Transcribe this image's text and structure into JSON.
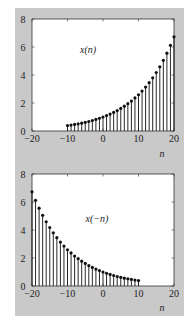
{
  "chart_data": [
    {
      "type": "stem",
      "title": "",
      "series_label": "x(n)",
      "xlabel": "n",
      "ylabel": "",
      "xlim": [
        -20,
        20
      ],
      "ylim": [
        0,
        8
      ],
      "xticks": [
        "-20",
        "-10",
        "0",
        "10",
        "20"
      ],
      "yticks": [
        "0",
        "2",
        "4",
        "6",
        "8"
      ],
      "grid": false,
      "x": [
        -10,
        -9,
        -8,
        -7,
        -6,
        -5,
        -4,
        -3,
        -2,
        -1,
        0,
        1,
        2,
        3,
        4,
        5,
        6,
        7,
        8,
        9,
        10,
        11,
        12,
        13,
        14,
        15,
        16,
        17,
        18,
        19,
        20
      ],
      "values": [
        0.39,
        0.42,
        0.47,
        0.51,
        0.56,
        0.62,
        0.68,
        0.75,
        0.83,
        0.91,
        1.0,
        1.1,
        1.21,
        1.33,
        1.46,
        1.61,
        1.77,
        1.95,
        2.14,
        2.36,
        2.59,
        2.85,
        3.14,
        3.45,
        3.8,
        4.18,
        4.59,
        5.05,
        5.56,
        6.12,
        6.73
      ]
    },
    {
      "type": "stem",
      "title": "",
      "series_label": "x(−n)",
      "xlabel": "n",
      "ylabel": "",
      "xlim": [
        -20,
        20
      ],
      "ylim": [
        0,
        8
      ],
      "xticks": [
        "-20",
        "-10",
        "0",
        "10",
        "20"
      ],
      "yticks": [
        "0",
        "2",
        "4",
        "6",
        "8"
      ],
      "grid": false,
      "x": [
        -20,
        -19,
        -18,
        -17,
        -16,
        -15,
        -14,
        -13,
        -12,
        -11,
        -10,
        -9,
        -8,
        -7,
        -6,
        -5,
        -4,
        -3,
        -2,
        -1,
        0,
        1,
        2,
        3,
        4,
        5,
        6,
        7,
        8,
        9,
        10
      ],
      "values": [
        6.73,
        6.12,
        5.56,
        5.05,
        4.59,
        4.18,
        3.8,
        3.45,
        3.14,
        2.85,
        2.59,
        2.36,
        2.14,
        1.95,
        1.77,
        1.61,
        1.46,
        1.33,
        1.21,
        1.1,
        1.0,
        0.91,
        0.83,
        0.75,
        0.68,
        0.62,
        0.56,
        0.51,
        0.47,
        0.42,
        0.39
      ]
    }
  ]
}
